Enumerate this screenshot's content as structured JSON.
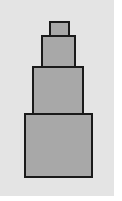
{
  "diagram": {
    "colors": {
      "background": "#e4e4e4",
      "fill": "#a8a8a8",
      "stroke": "#1a1a1a"
    },
    "tiers": [
      {
        "name": "top",
        "x": 49,
        "y": 21,
        "w": 21,
        "h": 16
      },
      {
        "name": "second",
        "x": 41,
        "y": 35,
        "w": 35,
        "h": 33
      },
      {
        "name": "third",
        "x": 32,
        "y": 66,
        "w": 52,
        "h": 49
      },
      {
        "name": "bottom",
        "x": 24,
        "y": 113,
        "w": 69,
        "h": 65
      }
    ]
  }
}
